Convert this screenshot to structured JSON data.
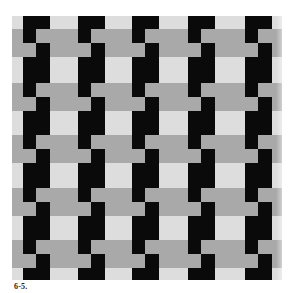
{
  "figure": {
    "caption": "6-5.",
    "fabric": {
      "x": 12,
      "y": 16,
      "width": 270,
      "height": 264
    },
    "colors": {
      "background": "#ffffff",
      "light_weft": "#dddddd",
      "gray_weft": "#a9a9a9",
      "black_warp": "#0a0a0a"
    },
    "warp_columns": {
      "x_positions": [
        23,
        78,
        132,
        188,
        245
      ],
      "left_strip_width": 13,
      "right_strip_width": 14
    },
    "gray_band_pairs": {
      "y_positions": [
        29,
        83,
        135,
        188,
        240
      ],
      "band_height": 14
    }
  }
}
